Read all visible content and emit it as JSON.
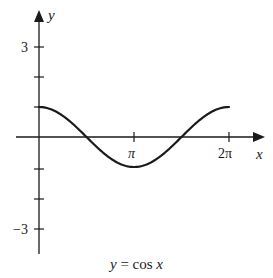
{
  "chart_data": {
    "type": "line",
    "title": "y = cos x",
    "xlabel": "x",
    "ylabel": "y",
    "function": "cos(x)",
    "xlim": [
      0,
      6.2832
    ],
    "ylim": [
      -3.8,
      3.9
    ],
    "x_ticks": [
      {
        "value": 3.1416,
        "label": "π"
      },
      {
        "value": 6.2832,
        "label": "2π"
      }
    ],
    "y_ticks": [
      {
        "value": 3,
        "label": "3"
      },
      {
        "value": 2,
        "label": ""
      },
      {
        "value": 1,
        "label": ""
      },
      {
        "value": -1,
        "label": ""
      },
      {
        "value": -2,
        "label": ""
      },
      {
        "value": -3,
        "label": "−3"
      }
    ],
    "series": [
      {
        "name": "cos x",
        "x": [
          0,
          0.7854,
          1.5708,
          2.3562,
          3.1416,
          3.927,
          4.7124,
          5.4978,
          6.2832
        ],
        "y": [
          1,
          0.707,
          0,
          -0.707,
          -1,
          -0.707,
          0,
          0.707,
          1
        ]
      }
    ],
    "grid": false,
    "legend": "none",
    "colors": {
      "ink": "#1a1a1a",
      "background": "#ffffff"
    }
  },
  "labels": {
    "y_axis": "y",
    "x_axis": "x",
    "tick_pi": "π",
    "tick_2pi": "2π",
    "tick_3": "3",
    "tick_neg3": "−3",
    "caption_y": "y",
    "caption_eq": " = cos ",
    "caption_x": "x"
  }
}
